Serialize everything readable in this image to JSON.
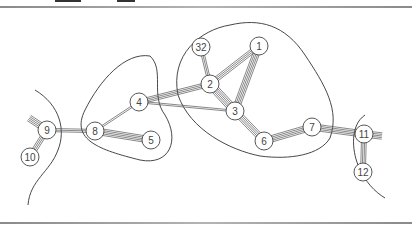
{
  "figure": {
    "nodes": [
      {
        "id": "1",
        "label": "1",
        "x": 259,
        "y": 46
      },
      {
        "id": "32",
        "label": "32",
        "x": 201,
        "y": 47
      },
      {
        "id": "2",
        "label": "2",
        "x": 210,
        "y": 84
      },
      {
        "id": "3",
        "label": "3",
        "x": 235,
        "y": 111
      },
      {
        "id": "4",
        "label": "4",
        "x": 139,
        "y": 102
      },
      {
        "id": "5",
        "label": "5",
        "x": 151,
        "y": 140
      },
      {
        "id": "6",
        "label": "6",
        "x": 264,
        "y": 141
      },
      {
        "id": "7",
        "label": "7",
        "x": 312,
        "y": 127
      },
      {
        "id": "8",
        "label": "8",
        "x": 95,
        "y": 131
      },
      {
        "id": "9",
        "label": "9",
        "x": 47,
        "y": 130
      },
      {
        "id": "10",
        "label": "10",
        "x": 30,
        "y": 157
      },
      {
        "id": "11",
        "label": "11",
        "x": 364,
        "y": 134
      },
      {
        "id": "12",
        "label": "12",
        "x": 363,
        "y": 172
      }
    ],
    "edges": [
      {
        "from": "1",
        "to": "2",
        "lines": 4
      },
      {
        "from": "1",
        "to": "3",
        "lines": 5
      },
      {
        "from": "32",
        "to": "2",
        "lines": 3
      },
      {
        "from": "2",
        "to": "3",
        "lines": 6
      },
      {
        "from": "4",
        "to": "2",
        "lines": 4
      },
      {
        "from": "4",
        "to": "3",
        "lines": 2
      },
      {
        "from": "4",
        "to": "8",
        "lines": 2
      },
      {
        "from": "8",
        "to": "5",
        "lines": 5
      },
      {
        "from": "9",
        "to": "8",
        "lines": 3
      },
      {
        "from": "9",
        "to": "10",
        "lines": 4
      },
      {
        "from": "3",
        "to": "6",
        "lines": 5
      },
      {
        "from": "6",
        "to": "7",
        "lines": 5
      },
      {
        "from": "7",
        "to": "11",
        "lines": 5
      },
      {
        "from": "11",
        "to": "12",
        "lines": 4
      }
    ],
    "stubs": [
      {
        "node": "9",
        "dx": -18,
        "dy": -12,
        "lines": 5
      },
      {
        "node": "11",
        "dx": 18,
        "dy": 2,
        "lines": 5
      }
    ],
    "regions": [
      {
        "name": "left-cluster",
        "path": "M35,90 C60,105 66,130 58,150 C50,172 30,180 28,205"
      },
      {
        "name": "middle-cluster",
        "path": "M150,56 C125,52 100,80 85,110 C70,140 100,150 140,160 C170,166 180,140 165,115 C150,95 165,70 150,56 Z"
      },
      {
        "name": "right-cluster",
        "path": "M230,25 C260,18 285,25 305,55 C325,85 340,110 330,138 C320,155 290,160 260,156 C230,150 190,130 178,95 C170,55 200,30 230,25 Z"
      },
      {
        "name": "far-right-cluster",
        "path": "M365,115 C350,125 352,150 358,165 C365,182 375,192 385,198"
      }
    ],
    "header_fragment_visible": true
  }
}
